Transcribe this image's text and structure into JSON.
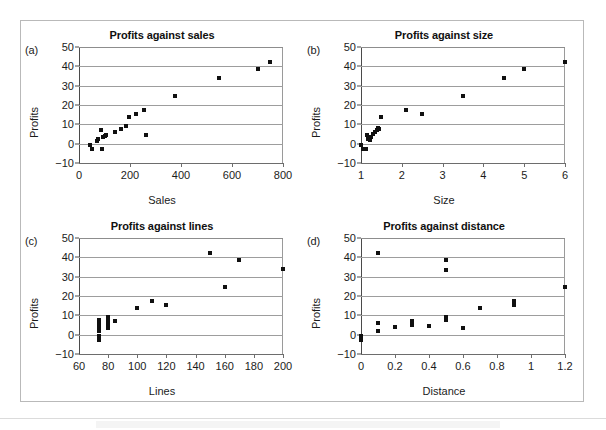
{
  "figure": {
    "panels": [
      {
        "tag": "(a)",
        "title": "Profits against sales",
        "xlabel": "Sales",
        "ylabel": "Profits"
      },
      {
        "tag": "(b)",
        "title": "Profits against size",
        "xlabel": "Size",
        "ylabel": "Profits"
      },
      {
        "tag": "(c)",
        "title": "Profits against lines",
        "xlabel": "Lines",
        "ylabel": "Profits"
      },
      {
        "tag": "(d)",
        "title": "Profits against distance",
        "xlabel": "Distance",
        "ylabel": "Profits"
      }
    ]
  },
  "chart_data": [
    {
      "type": "scatter",
      "panel": "(a)",
      "title": "Profits against sales",
      "xlabel": "Sales",
      "ylabel": "Profits",
      "xlim": [
        0,
        800
      ],
      "ylim": [
        -10,
        50
      ],
      "xticks": [
        0,
        200,
        400,
        600,
        800
      ],
      "yticks": [
        -10,
        0,
        10,
        20,
        30,
        40,
        50
      ],
      "xtick_labels": [
        "0",
        "200",
        "400",
        "600",
        "800"
      ],
      "ytick_labels": [
        "-10",
        "0",
        "10",
        "20",
        "30",
        "40",
        "50"
      ],
      "grid": "horizontal",
      "marker": "filled-square",
      "marker_color": "#101010",
      "points": [
        {
          "x": 45,
          "y": -0.5
        },
        {
          "x": 50,
          "y": -3.0
        },
        {
          "x": 70,
          "y": 1.5
        },
        {
          "x": 75,
          "y": 2.5
        },
        {
          "x": 85,
          "y": 7.0
        },
        {
          "x": 90,
          "y": -3.0
        },
        {
          "x": 95,
          "y": 3.5
        },
        {
          "x": 100,
          "y": 4.0
        },
        {
          "x": 105,
          "y": 4.5
        },
        {
          "x": 140,
          "y": 6.0
        },
        {
          "x": 165,
          "y": 7.5
        },
        {
          "x": 185,
          "y": 9.0
        },
        {
          "x": 195,
          "y": 13.8
        },
        {
          "x": 225,
          "y": 15.5
        },
        {
          "x": 255,
          "y": 17.3
        },
        {
          "x": 262,
          "y": 4.5
        },
        {
          "x": 378,
          "y": 24.4
        },
        {
          "x": 548,
          "y": 33.8
        },
        {
          "x": 700,
          "y": 38.7
        },
        {
          "x": 748,
          "y": 42.3
        }
      ]
    },
    {
      "type": "scatter",
      "panel": "(b)",
      "title": "Profits against size",
      "xlabel": "Size",
      "ylabel": "Profits",
      "xlim": [
        1,
        6
      ],
      "ylim": [
        -10,
        50
      ],
      "xticks": [
        1,
        2,
        3,
        4,
        5,
        6
      ],
      "yticks": [
        -10,
        0,
        10,
        20,
        30,
        40,
        50
      ],
      "xtick_labels": [
        "1",
        "2",
        "3",
        "4",
        "5",
        "6"
      ],
      "ytick_labels": [
        "-10",
        "0",
        "10",
        "20",
        "30",
        "40",
        "50"
      ],
      "grid": "horizontal",
      "marker": "filled-square",
      "marker_color": "#101010",
      "points": [
        {
          "x": 1.0,
          "y": -0.5
        },
        {
          "x": 1.05,
          "y": -3.0
        },
        {
          "x": 1.12,
          "y": -3.0
        },
        {
          "x": 1.15,
          "y": 4.3
        },
        {
          "x": 1.18,
          "y": 2.5
        },
        {
          "x": 1.22,
          "y": 1.8
        },
        {
          "x": 1.25,
          "y": 3.5
        },
        {
          "x": 1.3,
          "y": 5.0
        },
        {
          "x": 1.35,
          "y": 6.2
        },
        {
          "x": 1.38,
          "y": 7.0
        },
        {
          "x": 1.42,
          "y": 8.2
        },
        {
          "x": 1.45,
          "y": 7.5
        },
        {
          "x": 1.5,
          "y": 13.8
        },
        {
          "x": 2.1,
          "y": 17.3
        },
        {
          "x": 2.5,
          "y": 15.5
        },
        {
          "x": 3.5,
          "y": 24.4
        },
        {
          "x": 4.5,
          "y": 33.8
        },
        {
          "x": 5.0,
          "y": 38.7
        },
        {
          "x": 6.0,
          "y": 42.3
        }
      ]
    },
    {
      "type": "scatter",
      "panel": "(c)",
      "title": "Profits against lines",
      "xlabel": "Lines",
      "ylabel": "Profits",
      "xlim": [
        60,
        200
      ],
      "ylim": [
        -10,
        50
      ],
      "xticks": [
        60,
        80,
        100,
        120,
        140,
        160,
        180,
        200
      ],
      "yticks": [
        -10,
        0,
        10,
        20,
        30,
        40,
        50
      ],
      "xtick_labels": [
        "60",
        "80",
        "100",
        "120",
        "140",
        "160",
        "180",
        "200"
      ],
      "ytick_labels": [
        "-10",
        "0",
        "10",
        "20",
        "30",
        "40",
        "50"
      ],
      "grid": "horizontal",
      "marker": "filled-square",
      "marker_color": "#101010",
      "points": [
        {
          "x": 74,
          "y": -3.0
        },
        {
          "x": 74,
          "y": -0.5
        },
        {
          "x": 74,
          "y": 1.8
        },
        {
          "x": 74,
          "y": 2.5
        },
        {
          "x": 74,
          "y": 4.3
        },
        {
          "x": 74,
          "y": 6.2
        },
        {
          "x": 74,
          "y": 7.5
        },
        {
          "x": 80,
          "y": 3.5
        },
        {
          "x": 80,
          "y": 5.0
        },
        {
          "x": 80,
          "y": 7.0
        },
        {
          "x": 80,
          "y": 9.0
        },
        {
          "x": 85,
          "y": 7.0
        },
        {
          "x": 100,
          "y": 13.8
        },
        {
          "x": 110,
          "y": 17.3
        },
        {
          "x": 120,
          "y": 15.5
        },
        {
          "x": 150,
          "y": 42.3
        },
        {
          "x": 160,
          "y": 24.4
        },
        {
          "x": 170,
          "y": 38.7
        },
        {
          "x": 200,
          "y": 33.8
        }
      ]
    },
    {
      "type": "scatter",
      "panel": "(d)",
      "title": "Profits against distance",
      "xlabel": "Distance",
      "ylabel": "Profits",
      "xlim": [
        0,
        1.2
      ],
      "ylim": [
        -10,
        50
      ],
      "xticks": [
        0,
        0.2,
        0.4,
        0.6,
        0.8,
        1.0,
        1.2
      ],
      "yticks": [
        -10,
        0,
        10,
        20,
        30,
        40,
        50
      ],
      "xtick_labels": [
        "0",
        "0.2",
        "0.4",
        "0.6",
        "0.8",
        "1",
        "1.2"
      ],
      "ytick_labels": [
        "-10",
        "0",
        "10",
        "20",
        "30",
        "40",
        "50"
      ],
      "grid": "horizontal",
      "marker": "filled-square",
      "marker_color": "#101010",
      "points": [
        {
          "x": 0.0,
          "y": -0.5
        },
        {
          "x": 0.0,
          "y": -3.0
        },
        {
          "x": 0.1,
          "y": 42.3
        },
        {
          "x": 0.1,
          "y": 6.2
        },
        {
          "x": 0.1,
          "y": 2.0
        },
        {
          "x": 0.2,
          "y": 3.8
        },
        {
          "x": 0.3,
          "y": 7.0
        },
        {
          "x": 0.3,
          "y": 5.0
        },
        {
          "x": 0.4,
          "y": 4.7
        },
        {
          "x": 0.5,
          "y": 38.7
        },
        {
          "x": 0.5,
          "y": 33.5
        },
        {
          "x": 0.5,
          "y": 9.0
        },
        {
          "x": 0.5,
          "y": 7.5
        },
        {
          "x": 0.6,
          "y": 3.5
        },
        {
          "x": 0.7,
          "y": 13.8
        },
        {
          "x": 0.9,
          "y": 17.3
        },
        {
          "x": 0.9,
          "y": 15.5
        },
        {
          "x": 1.2,
          "y": 24.4
        }
      ]
    }
  ]
}
